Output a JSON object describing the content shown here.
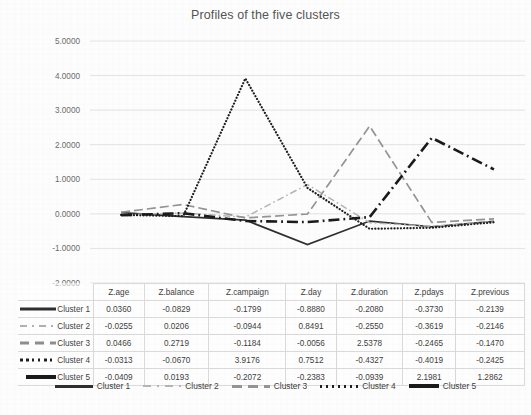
{
  "chart_data": {
    "type": "line",
    "title": "Profiles of the five clusters",
    "xlabel": "",
    "ylabel": "",
    "ylim": [
      -2.0,
      5.0
    ],
    "ytick_labels": [
      "5.0000",
      "4.0000",
      "3.0000",
      "2.0000",
      "1.0000",
      "0.0000",
      "-1.0000",
      "-2.0000"
    ],
    "ytick_values": [
      5,
      4,
      3,
      2,
      1,
      0,
      -1,
      -2
    ],
    "grid": true,
    "legend_position": "bottom",
    "categories": [
      "Z.age",
      "Z.balance",
      "Z.campaign",
      "Z.day",
      "Z.duration",
      "Z.pdays",
      "Z.previous"
    ],
    "series": [
      {
        "name": "Cluster 1",
        "style": "solid",
        "color": "#2f2f2f",
        "values": [
          0.036,
          -0.0829,
          -0.1799,
          -0.888,
          -0.208,
          -0.373,
          -0.2139
        ]
      },
      {
        "name": "Cluster 2",
        "style": "dash-dot",
        "color": "#b4b4b4",
        "values": [
          -0.0255,
          0.0206,
          -0.0944,
          0.8491,
          -0.255,
          -0.3619,
          -0.2146
        ]
      },
      {
        "name": "Cluster 3",
        "style": "dashed",
        "color": "#949494",
        "values": [
          0.0466,
          0.2719,
          -0.1184,
          -0.0056,
          2.5378,
          -0.2465,
          -0.147
        ]
      },
      {
        "name": "Cluster 4",
        "style": "dotted",
        "color": "#1f1f1f",
        "values": [
          -0.0313,
          -0.067,
          3.9176,
          0.7512,
          -0.4327,
          -0.4019,
          -0.2425
        ]
      },
      {
        "name": "Cluster 5",
        "style": "dash-dot-thick",
        "color": "#1a1a1a",
        "values": [
          -0.0409,
          0.0193,
          -0.2072,
          -0.2383,
          -0.0939,
          2.1981,
          1.2862
        ]
      }
    ]
  },
  "table": {
    "corner": "",
    "columns": [
      "Z.age",
      "Z.balance",
      "Z.campaign",
      "Z.day",
      "Z.duration",
      "Z.pdays",
      "Z.previous"
    ],
    "rows": [
      {
        "label": "Cluster 1",
        "values": [
          "0.0360",
          "-0.0829",
          "-0.1799",
          "-0.8880",
          "-0.2080",
          "-0.3730",
          "-0.2139"
        ]
      },
      {
        "label": "Cluster 2",
        "values": [
          "-0.0255",
          "0.0206",
          "-0.0944",
          "0.8491",
          "-0.2550",
          "-0.3619",
          "-0.2146"
        ]
      },
      {
        "label": "Cluster 3",
        "values": [
          "0.0466",
          "0.2719",
          "-0.1184",
          "-0.0056",
          "2.5378",
          "-0.2465",
          "-0.1470"
        ]
      },
      {
        "label": "Cluster 4",
        "values": [
          "-0.0313",
          "-0.0670",
          "3.9176",
          "0.7512",
          "-0.4327",
          "-0.4019",
          "-0.2425"
        ]
      },
      {
        "label": "Cluster 5",
        "values": [
          "-0.0409",
          "0.0193",
          "-0.2072",
          "-0.2383",
          "-0.0939",
          "2.1981",
          "1.2862"
        ]
      }
    ]
  },
  "legend": {
    "items": [
      "Cluster 1",
      "Cluster 2",
      "Cluster 3",
      "Cluster 4",
      "Cluster 5"
    ]
  }
}
